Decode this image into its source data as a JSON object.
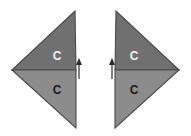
{
  "figure": {
    "background_color": "#ffffff",
    "width": 191,
    "height": 136,
    "colors": {
      "upper_triangle_fill": "#707070",
      "lower_triangle_fill": "#8c8c8c",
      "outline": "#4a4a4a",
      "label_on_dark": "#f2f2f2",
      "label_on_light": "#1a1a1a",
      "arrow": "#2b2b2b"
    },
    "shapes": [
      {
        "id": "left-dart",
        "name": "left-arrowhead-shape",
        "orientation": "points-right",
        "upper_triangle": {
          "name": "left-upper-triangle",
          "label": "C",
          "label_color": "#f2f2f2",
          "fill": "#707070",
          "points": "12,70 75,11 76,70"
        },
        "lower_triangle": {
          "name": "left-lower-triangle",
          "label": "C",
          "label_color": "#1a1a1a",
          "fill": "#8c8c8c",
          "points": "12,70 76,70 76,128"
        },
        "label_positions": {
          "upper": {
            "x": 57,
            "y": 57
          },
          "lower": {
            "x": 57,
            "y": 91
          }
        }
      },
      {
        "id": "right-dart",
        "name": "right-arrowhead-shape",
        "orientation": "points-left",
        "upper_triangle": {
          "name": "right-upper-triangle",
          "label": "C",
          "label_color": "#f2f2f2",
          "fill": "#707070",
          "points": "179,70 116,11 115,70"
        },
        "lower_triangle": {
          "name": "right-lower-triangle",
          "label": "C",
          "label_color": "#1a1a1a",
          "fill": "#8c8c8c",
          "points": "179,70 115,70 115,128"
        },
        "label_positions": {
          "upper": {
            "x": 134,
            "y": 57
          },
          "lower": {
            "x": 134,
            "y": 91
          }
        }
      }
    ],
    "arrows": [
      {
        "id": "left-center-arrow",
        "name": "left-center-up-arrow",
        "direction": "up",
        "x": 79,
        "y_top": 58,
        "y_bottom": 79,
        "color": "#2b2b2b"
      },
      {
        "id": "right-center-arrow",
        "name": "right-center-up-arrow",
        "direction": "up",
        "x": 112,
        "y_top": 58,
        "y_bottom": 79,
        "color": "#2b2b2b"
      }
    ]
  }
}
